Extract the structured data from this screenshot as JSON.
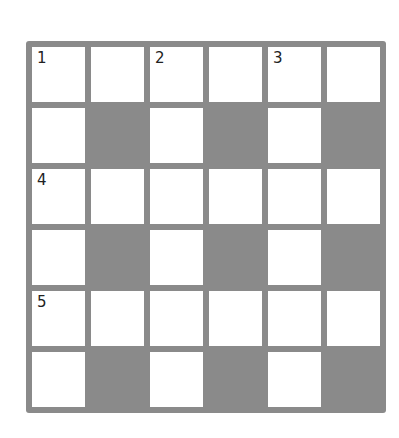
{
  "puzzle": {
    "type": "crossword",
    "rows": 6,
    "cols": 6,
    "colors": {
      "grid_line": "#8a8a8a",
      "block": "#8a8a8a",
      "open_cell": "#ffffff",
      "number_text": "#222222"
    },
    "cells": [
      [
        {
          "block": false,
          "number": "1"
        },
        {
          "block": false,
          "number": ""
        },
        {
          "block": false,
          "number": "2"
        },
        {
          "block": false,
          "number": ""
        },
        {
          "block": false,
          "number": "3"
        },
        {
          "block": false,
          "number": ""
        }
      ],
      [
        {
          "block": false,
          "number": ""
        },
        {
          "block": true,
          "number": ""
        },
        {
          "block": false,
          "number": ""
        },
        {
          "block": true,
          "number": ""
        },
        {
          "block": false,
          "number": ""
        },
        {
          "block": true,
          "number": ""
        }
      ],
      [
        {
          "block": false,
          "number": "4"
        },
        {
          "block": false,
          "number": ""
        },
        {
          "block": false,
          "number": ""
        },
        {
          "block": false,
          "number": ""
        },
        {
          "block": false,
          "number": ""
        },
        {
          "block": false,
          "number": ""
        }
      ],
      [
        {
          "block": false,
          "number": ""
        },
        {
          "block": true,
          "number": ""
        },
        {
          "block": false,
          "number": ""
        },
        {
          "block": true,
          "number": ""
        },
        {
          "block": false,
          "number": ""
        },
        {
          "block": true,
          "number": ""
        }
      ],
      [
        {
          "block": false,
          "number": "5"
        },
        {
          "block": false,
          "number": ""
        },
        {
          "block": false,
          "number": ""
        },
        {
          "block": false,
          "number": ""
        },
        {
          "block": false,
          "number": ""
        },
        {
          "block": false,
          "number": ""
        }
      ],
      [
        {
          "block": false,
          "number": ""
        },
        {
          "block": true,
          "number": ""
        },
        {
          "block": false,
          "number": ""
        },
        {
          "block": true,
          "number": ""
        },
        {
          "block": false,
          "number": ""
        },
        {
          "block": true,
          "number": ""
        }
      ]
    ]
  }
}
